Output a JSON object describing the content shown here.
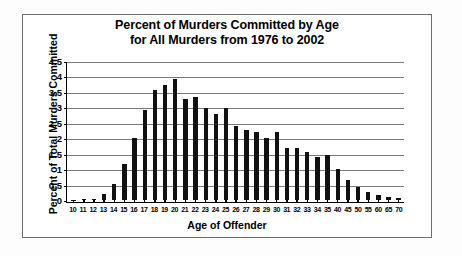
{
  "chart_data": {
    "type": "bar",
    "title": "Percent of Murders Committed by Age for All Murders from 1976 to 2002",
    "title_lines": [
      "Percent of Murders Committed by Age",
      "for All Murders from 1976 to 2002"
    ],
    "xlabel": "Age of Offender",
    "ylabel": "Percent of Total Murders Committed",
    "ylim": [
      0,
      4.5
    ],
    "ytick_labels": [
      "0",
      "0.5",
      "1",
      "1.5",
      "2",
      "2.5",
      "3",
      "3.5",
      "4",
      "4.5"
    ],
    "ytick_values": [
      0,
      0.5,
      1,
      1.5,
      2,
      2.5,
      3,
      3.5,
      4,
      4.5
    ],
    "grid": true,
    "legend": "none",
    "bar_color": "#111111",
    "categories": [
      "10",
      "11",
      "12",
      "13",
      "14",
      "15",
      "16",
      "17",
      "18",
      "19",
      "20",
      "21",
      "22",
      "23",
      "24",
      "25",
      "26",
      "27",
      "28",
      "29",
      "30",
      "31",
      "32",
      "33",
      "34",
      "35",
      "40",
      "45",
      "50",
      "55",
      "60",
      "65",
      "70"
    ],
    "values": [
      0.02,
      0.03,
      0.06,
      0.2,
      0.52,
      1.17,
      2.03,
      2.92,
      3.57,
      3.72,
      3.93,
      3.26,
      3.33,
      2.98,
      2.8,
      2.99,
      2.39,
      2.27,
      2.22,
      2.03,
      2.2,
      1.69,
      1.68,
      1.55,
      1.41,
      1.48,
      1.02,
      0.66,
      0.44,
      0.27,
      0.19,
      0.12,
      0.08
    ]
  }
}
